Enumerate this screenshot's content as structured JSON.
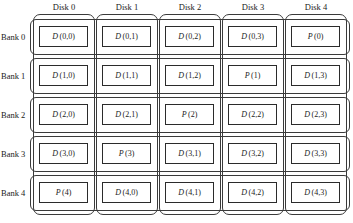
{
  "figure": {
    "row_header_label": "Bank",
    "column_header_label": "Disk"
  },
  "columns": [
    {
      "label": "Disk 0"
    },
    {
      "label": "Disk 1"
    },
    {
      "label": "Disk 2"
    },
    {
      "label": "Disk 3"
    },
    {
      "label": "Disk 4"
    }
  ],
  "rows": [
    {
      "label": "Bank 0"
    },
    {
      "label": "Bank 1"
    },
    {
      "label": "Bank 2"
    },
    {
      "label": "Bank 3"
    },
    {
      "label": "Bank 4"
    }
  ],
  "grid": [
    [
      {
        "kind": "data",
        "sym": "D",
        "idx": "(0,0)"
      },
      {
        "kind": "data",
        "sym": "D",
        "idx": "(0,1)"
      },
      {
        "kind": "data",
        "sym": "D",
        "idx": "(0,2)"
      },
      {
        "kind": "data",
        "sym": "D",
        "idx": "(0,3)"
      },
      {
        "kind": "parity",
        "sym": "P",
        "idx": "(0)"
      }
    ],
    [
      {
        "kind": "data",
        "sym": "D",
        "idx": "(1,0)"
      },
      {
        "kind": "data",
        "sym": "D",
        "idx": "(1,1)"
      },
      {
        "kind": "data",
        "sym": "D",
        "idx": "(1,2)"
      },
      {
        "kind": "parity",
        "sym": "P",
        "idx": "(1)"
      },
      {
        "kind": "data",
        "sym": "D",
        "idx": "(1,3)"
      }
    ],
    [
      {
        "kind": "data",
        "sym": "D",
        "idx": "(2,0)"
      },
      {
        "kind": "data",
        "sym": "D",
        "idx": "(2,1)"
      },
      {
        "kind": "parity",
        "sym": "P",
        "idx": "(2)"
      },
      {
        "kind": "data",
        "sym": "D",
        "idx": "(2,2)"
      },
      {
        "kind": "data",
        "sym": "D",
        "idx": "(2,3)"
      }
    ],
    [
      {
        "kind": "data",
        "sym": "D",
        "idx": "(3,0)"
      },
      {
        "kind": "parity",
        "sym": "P",
        "idx": "(3)"
      },
      {
        "kind": "data",
        "sym": "D",
        "idx": "(3,1)"
      },
      {
        "kind": "data",
        "sym": "D",
        "idx": "(3,2)"
      },
      {
        "kind": "data",
        "sym": "D",
        "idx": "(3,3)"
      }
    ],
    [
      {
        "kind": "parity",
        "sym": "P",
        "idx": "(4)"
      },
      {
        "kind": "data",
        "sym": "D",
        "idx": "(4,0)"
      },
      {
        "kind": "data",
        "sym": "D",
        "idx": "(4,1)"
      },
      {
        "kind": "data",
        "sym": "D",
        "idx": "(4,2)"
      },
      {
        "kind": "data",
        "sym": "D",
        "idx": "(4,3)"
      }
    ]
  ],
  "colors": {
    "background": "#ffffff",
    "stroke": "#3a3a3a",
    "block_stroke": "#2b2b2b",
    "text": "#1a1a1a"
  },
  "layout": {
    "column_x": [
      36,
      99,
      162,
      225,
      288
    ],
    "column_width": 58,
    "row_y": [
      18,
      57,
      96,
      135,
      174
    ],
    "row_height": 36,
    "block_width": 49,
    "block_height": 21
  }
}
